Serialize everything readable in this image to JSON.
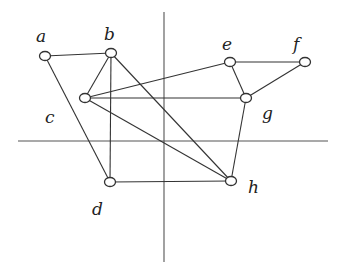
{
  "diagram": {
    "type": "graph",
    "axes": {
      "vertical": {
        "x": 164,
        "y1": 12,
        "y2": 262
      },
      "horizontal": {
        "y": 141,
        "x1": 18,
        "x2": 328
      }
    },
    "nodes": [
      {
        "id": "a",
        "label": "a",
        "x": 45,
        "y": 56,
        "lx": 36,
        "ly": 42
      },
      {
        "id": "b",
        "label": "b",
        "x": 111,
        "y": 53,
        "lx": 104,
        "ly": 40
      },
      {
        "id": "c",
        "label": "c",
        "x": 85,
        "y": 98,
        "lx": 45,
        "ly": 123
      },
      {
        "id": "d",
        "label": "d",
        "x": 110,
        "y": 182,
        "lx": 92,
        "ly": 215
      },
      {
        "id": "e",
        "label": "e",
        "x": 230,
        "y": 62,
        "lx": 222,
        "ly": 50
      },
      {
        "id": "f",
        "label": "f",
        "x": 305,
        "y": 62,
        "lx": 293,
        "ly": 50
      },
      {
        "id": "g",
        "label": "g",
        "x": 246,
        "y": 98,
        "lx": 262,
        "ly": 119
      },
      {
        "id": "h",
        "label": "h",
        "x": 231,
        "y": 181,
        "lx": 248,
        "ly": 193
      }
    ],
    "edges": [
      [
        "a",
        "b"
      ],
      [
        "a",
        "d"
      ],
      [
        "b",
        "c"
      ],
      [
        "b",
        "d"
      ],
      [
        "b",
        "h"
      ],
      [
        "c",
        "e"
      ],
      [
        "c",
        "g"
      ],
      [
        "c",
        "h"
      ],
      [
        "e",
        "f"
      ],
      [
        "e",
        "g"
      ],
      [
        "f",
        "g"
      ],
      [
        "g",
        "h"
      ],
      [
        "d",
        "h"
      ]
    ]
  }
}
